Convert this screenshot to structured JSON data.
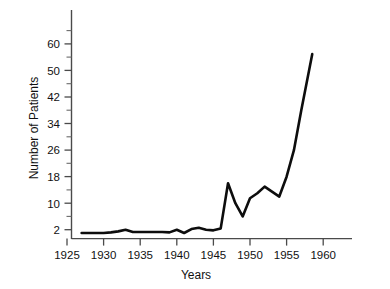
{
  "chart_data": {
    "type": "line",
    "title": "",
    "subtitle": "",
    "xlabel": "Years",
    "ylabel": "Number of Patients",
    "xlim": [
      1924,
      1962
    ],
    "ylim": [
      0,
      64
    ],
    "grid": false,
    "legend": null,
    "x_ticks": [
      1925,
      1930,
      1935,
      1940,
      1945,
      1950,
      1955,
      1960
    ],
    "x_tick_labels": [
      "1925",
      "1930",
      "1935",
      "1940",
      "1945",
      "1950",
      "1955",
      "1960"
    ],
    "y_ticks": [
      2,
      10,
      18,
      26,
      34,
      42,
      50,
      60
    ],
    "y_tick_labels": [
      "2",
      "10",
      "18",
      "26",
      "34",
      "42",
      "50",
      "60"
    ],
    "y_minor_ticks": [
      6,
      14,
      22,
      30,
      38,
      46,
      55
    ],
    "series": [
      {
        "name": "Number of Patients",
        "color": "#0d0d0d",
        "x": [
          1927,
          1928,
          1929,
          1930,
          1931,
          1932,
          1933,
          1934,
          1935,
          1936,
          1937,
          1938,
          1939,
          1940,
          1941,
          1942,
          1943,
          1944,
          1945,
          1946,
          1947,
          1948,
          1949,
          1950,
          1951,
          1952,
          1953,
          1954,
          1955,
          1956,
          1957,
          1958.5
        ],
        "y": [
          1,
          1,
          1,
          1,
          1.2,
          1.5,
          2,
          1.3,
          1.3,
          1.3,
          1.3,
          1.3,
          1.2,
          2,
          1,
          2.2,
          2.6,
          2,
          1.8,
          2.4,
          16,
          10,
          6,
          11.5,
          13,
          15,
          13.5,
          12,
          18,
          26,
          38,
          55
        ]
      }
    ]
  },
  "axis": {
    "y_label": "Number of Patients",
    "x_label": "Years"
  }
}
